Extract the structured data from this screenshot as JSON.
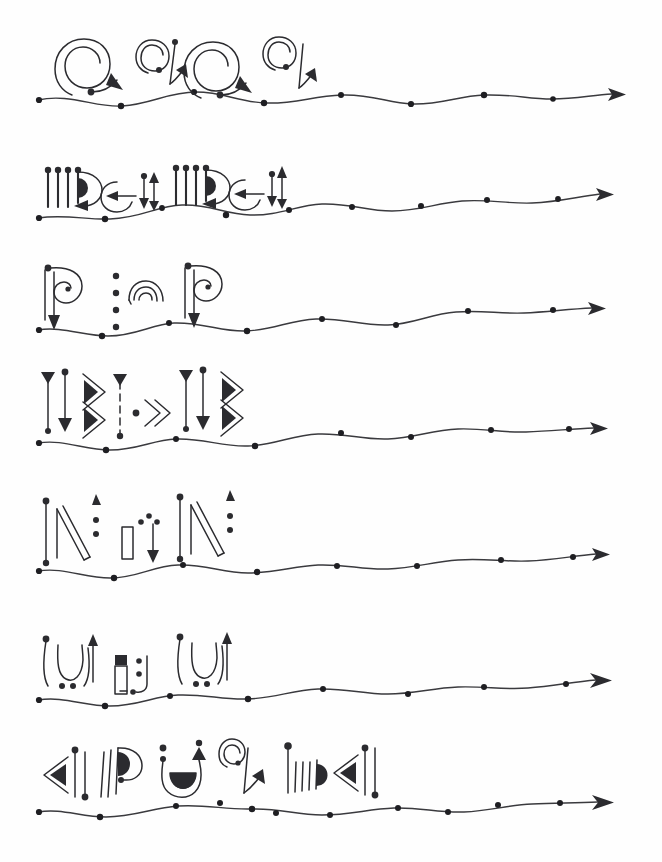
{
  "document": {
    "title": "Asemic Script Manuscript",
    "medium": "ink on paper",
    "background_color": "#fefefe",
    "ink_color": "#2b2b2f",
    "width": 662,
    "height": 862,
    "line_count": 7,
    "description": "Seven horizontal lines of invented hand-drawn script glyphs, each sitting above a wavy baseline that is studded with round dots and terminates in a solid rightward arrowhead."
  },
  "lines": [
    {
      "index": 1,
      "name": "line-1",
      "baseline_y": 98,
      "baseline_start_x": 38,
      "baseline_end_x": 622,
      "dot_count": 8,
      "glyph_count": 4,
      "glyph_span_x": [
        70,
        310
      ],
      "glyphs": [
        {
          "name": "spiral-large-with-down-arrow",
          "motif": "spiral",
          "size": "large",
          "x": 72
        },
        {
          "name": "spiral-small-with-up-arrow",
          "motif": "spiral",
          "size": "small",
          "x": 145
        },
        {
          "name": "spiral-large-with-down-arrow",
          "motif": "spiral",
          "size": "large",
          "x": 200
        },
        {
          "name": "spiral-small-with-up-arrow",
          "motif": "spiral",
          "size": "small",
          "x": 272
        }
      ]
    },
    {
      "index": 2,
      "name": "line-2",
      "baseline_y": 205,
      "baseline_start_x": 38,
      "baseline_end_x": 622,
      "dot_count": 8,
      "glyph_count": 4,
      "glyph_span_x": [
        40,
        285
      ],
      "glyphs": [
        {
          "name": "triple-stem-with-half-disc",
          "motif": "comb-and-bowl",
          "x": 44
        },
        {
          "name": "circle-with-left-arrow-and-double-arrow",
          "motif": "ring-arrows",
          "x": 108
        },
        {
          "name": "triple-stem-with-half-disc",
          "motif": "comb-and-bowl",
          "x": 172
        },
        {
          "name": "circle-with-left-arrow-and-double-arrow",
          "motif": "ring-arrows",
          "x": 232
        }
      ]
    },
    {
      "index": 3,
      "name": "line-3",
      "baseline_y": 320,
      "baseline_start_x": 38,
      "baseline_end_x": 622,
      "dot_count": 8,
      "glyph_count": 3,
      "glyph_span_x": [
        40,
        230
      ],
      "glyphs": [
        {
          "name": "spiral-bowl-with-down-arrow",
          "motif": "spiral-stem",
          "x": 44
        },
        {
          "name": "four-dots-with-nested-arcs",
          "motif": "dots-and-arcs",
          "x": 112
        },
        {
          "name": "spiral-bowl-with-down-arrow",
          "motif": "spiral-stem",
          "x": 182
        }
      ]
    },
    {
      "index": 4,
      "name": "line-4",
      "baseline_y": 434,
      "baseline_start_x": 38,
      "baseline_end_x": 622,
      "dot_count": 8,
      "glyph_count": 3,
      "glyph_span_x": [
        40,
        235
      ],
      "glyphs": [
        {
          "name": "double-stem-with-double-chevron",
          "motif": "stems-chevrons",
          "x": 44
        },
        {
          "name": "dashed-stem-with-double-chevron",
          "motif": "dashed-chevrons",
          "x": 118
        },
        {
          "name": "double-stem-with-double-chevron",
          "motif": "stems-chevrons",
          "x": 182
        }
      ]
    },
    {
      "index": 5,
      "name": "line-5",
      "baseline_y": 560,
      "baseline_start_x": 38,
      "baseline_end_x": 622,
      "dot_count": 8,
      "glyph_count": 3,
      "glyph_span_x": [
        40,
        235
      ],
      "glyphs": [
        {
          "name": "slanted-bar-with-triangle-and-dots",
          "motif": "slant-triangle",
          "x": 44
        },
        {
          "name": "small-rect-with-dots-and-down-arrow",
          "motif": "rect-arrow",
          "x": 118
        },
        {
          "name": "slanted-bar-with-triangle-and-dots",
          "motif": "slant-triangle",
          "x": 176
        }
      ]
    },
    {
      "index": 6,
      "name": "line-6",
      "baseline_y": 690,
      "baseline_start_x": 38,
      "baseline_end_x": 622,
      "dot_count": 8,
      "glyph_count": 3,
      "glyph_span_x": [
        40,
        230
      ],
      "glyphs": [
        {
          "name": "u-cup-with-up-arrow-and-dots",
          "motif": "cup-arrow",
          "x": 44
        },
        {
          "name": "tall-rect-with-dots-and-hook",
          "motif": "rect-hook",
          "x": 110
        },
        {
          "name": "u-cup-with-up-arrow-and-dots",
          "motif": "cup-arrow",
          "x": 176
        }
      ]
    },
    {
      "index": 7,
      "name": "line-7",
      "baseline_y": 803,
      "baseline_start_x": 38,
      "baseline_end_x": 622,
      "dot_count": 9,
      "glyph_count": 6,
      "glyph_span_x": [
        40,
        390
      ],
      "glyphs": [
        {
          "name": "left-chevron-with-pin-stems",
          "motif": "chevron-pins",
          "x": 42
        },
        {
          "name": "double-line-with-half-disc-bowl",
          "motif": "lines-bowl",
          "x": 102
        },
        {
          "name": "u-vessel-with-dots-and-triangle",
          "motif": "vessel",
          "x": 155
        },
        {
          "name": "spiral-with-up-arrow",
          "motif": "spiral",
          "x": 222
        },
        {
          "name": "comb-with-half-disc",
          "motif": "comb-bowl",
          "x": 278
        },
        {
          "name": "left-chevron-with-pin-stems",
          "motif": "chevron-pins",
          "x": 334
        }
      ]
    }
  ]
}
